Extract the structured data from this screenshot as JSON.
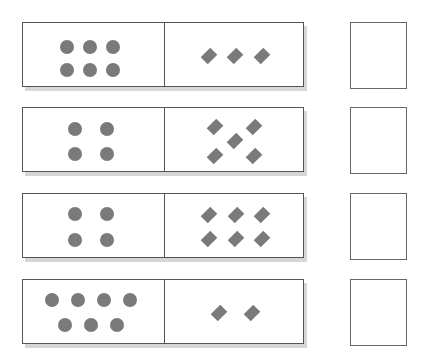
{
  "title": "",
  "colors": {
    "shape": "#7a7a7a",
    "border": "#555555",
    "shadow": "#d6d6d6"
  },
  "rows": [
    {
      "top": 22,
      "circles": 6,
      "diamonds": 3,
      "circle_pos": [
        [
          37,
          17
        ],
        [
          60,
          17
        ],
        [
          83,
          17
        ],
        [
          37,
          40
        ],
        [
          60,
          40
        ],
        [
          83,
          40
        ]
      ],
      "diamond_pos": [
        [
          40,
          28
        ],
        [
          66,
          28
        ],
        [
          93,
          28
        ]
      ],
      "answer": ""
    },
    {
      "top": 107,
      "circles": 4,
      "diamonds": 5,
      "circle_pos": [
        [
          45,
          14
        ],
        [
          77,
          14
        ],
        [
          45,
          39
        ],
        [
          77,
          39
        ]
      ],
      "diamond_pos": [
        [
          46,
          14
        ],
        [
          85,
          14
        ],
        [
          66,
          28
        ],
        [
          46,
          43
        ],
        [
          85,
          43
        ]
      ],
      "answer": ""
    },
    {
      "top": 193,
      "circles": 4,
      "diamonds": 6,
      "circle_pos": [
        [
          45,
          13
        ],
        [
          77,
          13
        ],
        [
          45,
          39
        ],
        [
          77,
          39
        ]
      ],
      "diamond_pos": [
        [
          40,
          16
        ],
        [
          67,
          16
        ],
        [
          93,
          16
        ],
        [
          40,
          40
        ],
        [
          67,
          40
        ],
        [
          93,
          40
        ]
      ],
      "answer": ""
    },
    {
      "top": 279,
      "circles": 7,
      "diamonds": 2,
      "circle_pos": [
        [
          22,
          13
        ],
        [
          48,
          13
        ],
        [
          74,
          13
        ],
        [
          100,
          13
        ],
        [
          35,
          38
        ],
        [
          61,
          38
        ],
        [
          87,
          38
        ]
      ],
      "diamond_pos": [
        [
          50,
          28
        ],
        [
          83,
          28
        ]
      ],
      "answer": ""
    }
  ]
}
